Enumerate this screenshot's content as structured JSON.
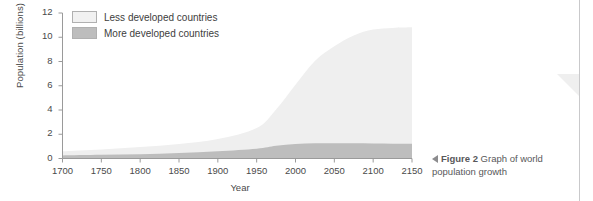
{
  "chart_data": {
    "type": "area",
    "title": "",
    "xlabel": "Year",
    "ylabel": "Population (billions)",
    "xlim": [
      1700,
      2150
    ],
    "ylim": [
      0,
      12
    ],
    "xticks": [
      1700,
      1750,
      1800,
      1850,
      1900,
      1950,
      2000,
      2050,
      2100,
      2150
    ],
    "yticks": [
      0,
      2,
      4,
      6,
      8,
      10,
      12
    ],
    "grid": false,
    "stacked": true,
    "legend_position": "top-left",
    "x": [
      1700,
      1750,
      1800,
      1850,
      1900,
      1950,
      1975,
      2000,
      2025,
      2050,
      2075,
      2100,
      2125,
      2150
    ],
    "series": [
      {
        "name": "More developed countries",
        "color": "#b9b9b9",
        "values": [
          0.25,
          0.3,
          0.35,
          0.45,
          0.6,
          0.81,
          1.05,
          1.19,
          1.25,
          1.26,
          1.25,
          1.23,
          1.22,
          1.22
        ]
      },
      {
        "name": "Less developed countries",
        "color": "#efefef",
        "values": [
          0.35,
          0.45,
          0.6,
          0.75,
          1.0,
          1.7,
          3.0,
          4.9,
          6.8,
          8.0,
          8.9,
          9.4,
          9.55,
          9.6
        ]
      }
    ],
    "totals": [
      0.6,
      0.75,
      0.95,
      1.2,
      1.6,
      2.51,
      4.05,
      6.09,
      8.05,
      9.26,
      10.15,
      10.63,
      10.77,
      10.82
    ]
  },
  "legend": {
    "items": [
      {
        "label": "Less developed countries",
        "color": "#efefef"
      },
      {
        "label": "More developed countries",
        "color": "#b9b9b9"
      }
    ]
  },
  "axes": {
    "y_title": "Population (billions)",
    "x_title": "Year",
    "y_labels": [
      "12",
      "10",
      "8",
      "6",
      "4",
      "2",
      "0"
    ],
    "x_labels": [
      "1700",
      "1750",
      "1800",
      "1850",
      "1900",
      "1950",
      "2000",
      "2050",
      "2100",
      "2150"
    ]
  },
  "caption": {
    "figure_number": "Figure 2",
    "text": " Graph of world population growth"
  }
}
